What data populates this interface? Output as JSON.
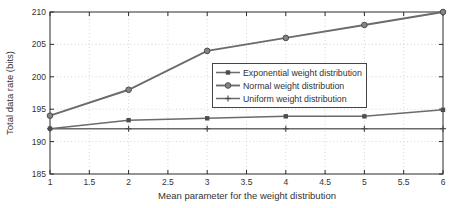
{
  "chart_data": {
    "type": "line",
    "title": "",
    "xlabel": "Mean parameter for the weight distribution",
    "ylabel": "Total data rate (bits)",
    "x": [
      1,
      2,
      3,
      4,
      5,
      6
    ],
    "series": [
      {
        "name": "Exponential weight distribution",
        "marker": "square",
        "values": [
          192,
          193.3,
          193.6,
          193.9,
          193.9,
          194.9
        ]
      },
      {
        "name": "Normal weight distribution",
        "marker": "circle",
        "values": [
          194,
          198,
          204,
          206,
          208,
          210
        ]
      },
      {
        "name": "Uniform weight distribution",
        "marker": "plus",
        "values": [
          192,
          192,
          192,
          192,
          192,
          192
        ]
      }
    ],
    "xlim": [
      1,
      6
    ],
    "ylim": [
      185,
      210
    ],
    "xticks": [
      1,
      1.5,
      2,
      2.5,
      3,
      3.5,
      4,
      4.5,
      5,
      5.5,
      6
    ],
    "yticks": [
      185,
      190,
      195,
      200,
      205,
      210
    ],
    "grid": true,
    "legend": {
      "position": "right-center",
      "entries": [
        "Exponential weight distribution",
        "Normal weight distribution",
        "Uniform weight distribution"
      ]
    },
    "colors": {
      "line": "#6b6b6b",
      "marker": "#4d4d4d",
      "marker_fill": "#858585",
      "grid": "#cccccc",
      "axis": "#2a2a2a",
      "text": "#333333",
      "legend_border": "#444444",
      "background": "#ffffff"
    }
  }
}
